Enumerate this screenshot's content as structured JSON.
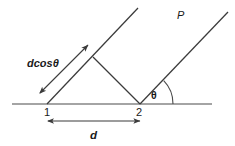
{
  "figure": {
    "type": "geometry-diagram",
    "background_color": "#ffffff",
    "line_color": "#3b3b3b",
    "text_color": "#1a1a1a",
    "width": 235,
    "height": 146,
    "labels": {
      "point_1": "1",
      "point_2": "2",
      "projection": "dcosθ",
      "separation": "d",
      "angle": "θ",
      "plane": "P"
    },
    "geometry": {
      "baseline": {
        "x1": 12,
        "y1": 104,
        "x2": 212,
        "y2": 104
      },
      "point_1": {
        "x": 47,
        "y": 104
      },
      "point_2": {
        "x": 140,
        "y": 104
      },
      "left_ray": {
        "x1": 47,
        "y1": 104,
        "x2": 138,
        "y2": 8
      },
      "right_ray": {
        "x1": 140,
        "y1": 104,
        "x2": 228,
        "y2": 12
      },
      "perpendicular": {
        "x1": 93,
        "y1": 57,
        "x2": 140,
        "y2": 104
      },
      "dimension_arrow": {
        "x1": 47,
        "y1": 121,
        "x2": 141,
        "y2": 121
      },
      "projection_arrow": {
        "x1": 40,
        "y1": 93,
        "x2": 88,
        "y2": 45
      },
      "angle_arc_radius": 33,
      "angle_degrees": 45
    },
    "label_positions": {
      "point_1": {
        "x": 44,
        "y": 116
      },
      "point_2": {
        "x": 137,
        "y": 116
      },
      "projection": {
        "x": 27,
        "y": 67
      },
      "separation": {
        "x": 90,
        "y": 138
      },
      "angle": {
        "x": 151,
        "y": 98
      },
      "plane": {
        "x": 177,
        "y": 18
      }
    }
  }
}
